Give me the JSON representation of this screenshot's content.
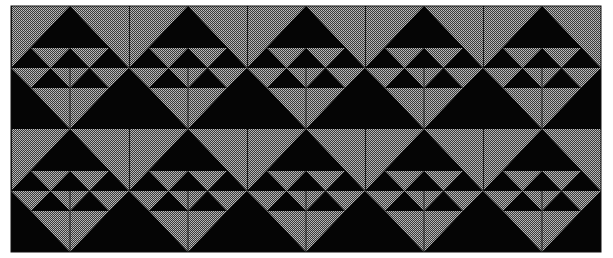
{
  "image": {
    "description": "Repeating geometric quilt-like pattern of black and dithered gray triangles",
    "frame": {
      "x": 11,
      "y": 6,
      "width": 590,
      "height": 246
    },
    "grid": {
      "columns": 5,
      "rows": 2,
      "tile_width": 118,
      "tile_height": 123
    },
    "colors": {
      "background": "#ffffff",
      "black": "#050505",
      "gray_light": "#b4b4b4",
      "gray_dark": "#3a3a3a",
      "line": "#1a1a1a"
    }
  }
}
